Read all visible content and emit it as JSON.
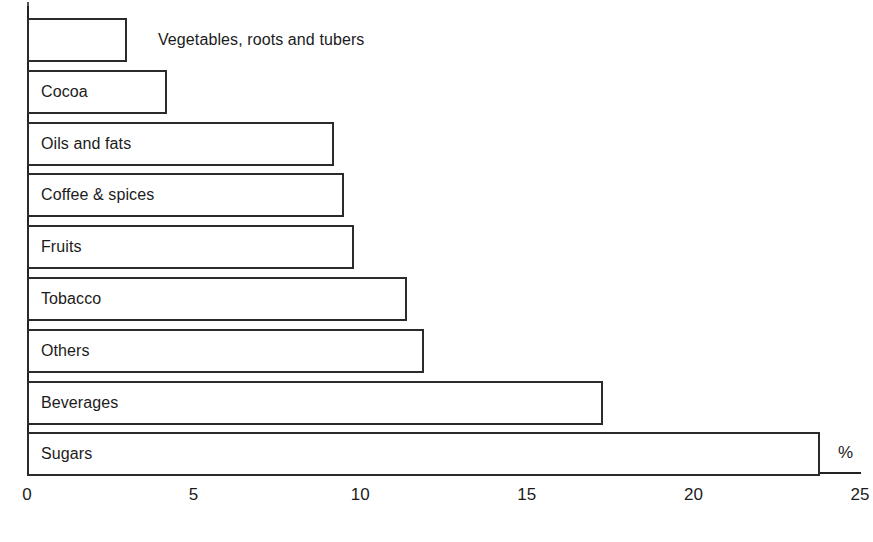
{
  "chart_data": {
    "type": "bar",
    "orientation": "horizontal",
    "title": "",
    "subtitle": "",
    "xlabel": "%",
    "ylabel": "",
    "grid": false,
    "legend": null,
    "xlim": [
      0,
      25
    ],
    "xticks": [
      "0",
      "5",
      "10",
      "15",
      "20",
      "25"
    ],
    "xtick_values": [
      0,
      5,
      10,
      15,
      20,
      25
    ],
    "categories": [
      "Vegetables, roots and tubers",
      "Cocoa",
      "Oils and fats",
      "Coffee & spices",
      "Fruits",
      "Tobacco",
      "Others",
      "Beverages",
      "Sugars"
    ],
    "values": [
      3.0,
      4.2,
      9.2,
      9.5,
      9.8,
      11.4,
      11.9,
      17.3,
      23.8
    ],
    "label_placement": [
      "outside",
      "inside",
      "inside",
      "inside",
      "inside",
      "inside",
      "inside",
      "inside",
      "inside"
    ],
    "colors": {
      "bar_fill": "#ffffff",
      "bar_stroke": "#2b2b2b",
      "axis": "#222222",
      "text": "#1b1b1b",
      "background": "#ffffff"
    }
  },
  "axis": {
    "unit_marker": "%"
  }
}
